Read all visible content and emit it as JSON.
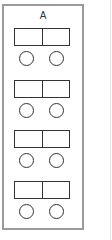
{
  "panel": {
    "label": "A",
    "border_color": "#9a9a9a",
    "shape_color": "#333333",
    "groups": [
      {
        "boxes": 2,
        "circles": 2
      },
      {
        "boxes": 2,
        "circles": 2
      },
      {
        "boxes": 2,
        "circles": 2
      },
      {
        "boxes": 2,
        "circles": 2
      }
    ]
  }
}
